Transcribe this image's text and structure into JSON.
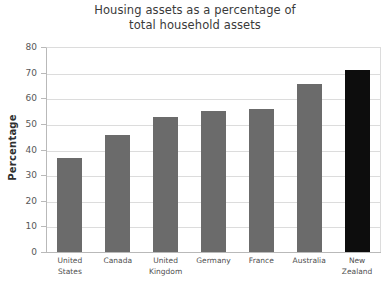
{
  "chart_data": {
    "type": "bar",
    "title": "Housing assets as a percentage of total household assets",
    "title_lines": [
      "Housing assets as a percentage of",
      "total household assets"
    ],
    "categories": [
      "United States",
      "Canada",
      "United Kingdom",
      "Germany",
      "France",
      "Australia",
      "New Zealand"
    ],
    "category_lines": [
      [
        "United",
        "States"
      ],
      [
        "Canada"
      ],
      [
        "United",
        "Kingdom"
      ],
      [
        "Germany"
      ],
      [
        "France"
      ],
      [
        "Australia"
      ],
      [
        "New",
        "Zealand"
      ]
    ],
    "values": [
      36.8,
      45.8,
      52.5,
      55.0,
      56.0,
      65.5,
      71.0
    ],
    "xlabel": "",
    "ylabel": "Percentage",
    "ylim": [
      0,
      80
    ],
    "ytick_step": 10,
    "yticks": [
      0,
      10,
      20,
      30,
      40,
      50,
      60,
      70,
      80
    ],
    "ytick_labels": [
      "0",
      "10",
      "20",
      "30",
      "40",
      "50",
      "60",
      "70",
      "80"
    ],
    "grid": true,
    "legend": null,
    "bar_color": "#6b6b6b",
    "highlight_color": "#0d0d0d",
    "highlight_index": 6,
    "gridline_color": "#dcdcdc",
    "axis_color": "#b9b9b9"
  }
}
